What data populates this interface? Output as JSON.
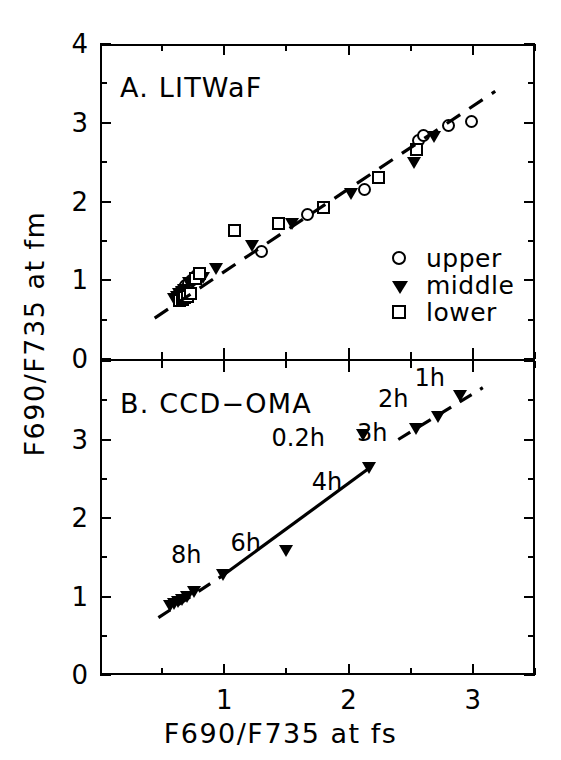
{
  "figure": {
    "axis_titles": {
      "x": "F690/F735 at fs",
      "y": "F690/F735 at fm"
    },
    "panels": [
      {
        "id": "A",
        "title": "A.   LITWaF"
      },
      {
        "id": "B",
        "title": "B.   CCD−OMA"
      }
    ],
    "legend": {
      "items": [
        {
          "symbol": "circle",
          "label": "upper"
        },
        {
          "symbol": "triangle",
          "label": "middle"
        },
        {
          "symbol": "square",
          "label": "lower"
        }
      ]
    },
    "tick_labels": {
      "panel_a_y": [
        "0",
        "1",
        "2",
        "3",
        "4"
      ],
      "panel_b_y": [
        "0",
        "1",
        "2",
        "3"
      ],
      "x": [
        "1",
        "2",
        "3"
      ]
    },
    "colors": {
      "axis": "#000000",
      "marker_fill_open": "#ffffff",
      "marker_fill_solid": "#000000"
    }
  },
  "chart_data": [
    {
      "type": "scatter",
      "panel": "A",
      "title": "A.   LITWaF",
      "xlabel": "F690/F735 at fs",
      "ylabel": "F690/F735 at fm",
      "xlim": [
        0,
        3.5
      ],
      "ylim": [
        0,
        4
      ],
      "xticks": [
        1,
        2,
        3
      ],
      "yticks": [
        0,
        1,
        2,
        3,
        4
      ],
      "grid": false,
      "legend_position": "lower-right-inside",
      "series": [
        {
          "name": "upper",
          "marker": "open-circle",
          "points": [
            [
              0.63,
              0.82
            ],
            [
              0.65,
              0.86
            ],
            [
              0.67,
              0.9
            ],
            [
              0.69,
              0.93
            ],
            [
              0.71,
              0.96
            ],
            [
              0.74,
              1.0
            ],
            [
              0.78,
              1.06
            ],
            [
              1.3,
              1.36
            ],
            [
              1.67,
              1.84
            ],
            [
              2.13,
              2.15
            ],
            [
              2.56,
              2.77
            ],
            [
              2.6,
              2.84
            ],
            [
              2.8,
              2.96
            ],
            [
              2.99,
              3.02
            ]
          ]
        },
        {
          "name": "middle",
          "marker": "filled-triangle",
          "points": [
            [
              0.6,
              0.76
            ],
            [
              0.62,
              0.79
            ],
            [
              0.64,
              0.82
            ],
            [
              0.66,
              0.85
            ],
            [
              0.68,
              0.88
            ],
            [
              0.72,
              0.96
            ],
            [
              0.83,
              1.03
            ],
            [
              0.94,
              1.14
            ],
            [
              1.23,
              1.43
            ],
            [
              1.55,
              1.71
            ],
            [
              2.02,
              2.09
            ],
            [
              2.53,
              2.49
            ],
            [
              2.69,
              2.82
            ]
          ]
        },
        {
          "name": "lower",
          "marker": "open-square",
          "points": [
            [
              0.64,
              0.74
            ],
            [
              0.66,
              0.76
            ],
            [
              0.68,
              0.78
            ],
            [
              0.7,
              0.8
            ],
            [
              0.73,
              0.83
            ],
            [
              0.77,
              1.02
            ],
            [
              0.8,
              1.09
            ],
            [
              1.08,
              1.63
            ],
            [
              1.44,
              1.72
            ],
            [
              1.8,
              1.92
            ],
            [
              2.24,
              2.3
            ],
            [
              2.55,
              2.66
            ]
          ]
        }
      ],
      "trend_line": {
        "style": "dashed",
        "from": [
          0.44,
          0.52
        ],
        "to": [
          3.18,
          3.4
        ]
      }
    },
    {
      "type": "scatter",
      "panel": "B",
      "title": "B.   CCD−OMA",
      "xlabel": "F690/F735 at fs",
      "ylabel": "F690/F735 at fm",
      "xlim": [
        0,
        3.5
      ],
      "ylim": [
        0,
        4
      ],
      "xticks": [
        1,
        2,
        3
      ],
      "yticks": [
        0,
        1,
        2,
        3
      ],
      "grid": false,
      "series": [
        {
          "name": "middle",
          "marker": "filled-triangle",
          "points": [
            [
              0.57,
              0.88
            ],
            [
              0.6,
              0.9
            ],
            [
              0.63,
              0.93
            ],
            [
              0.66,
              0.96
            ],
            [
              0.7,
              1.0
            ],
            [
              0.76,
              1.06
            ],
            [
              0.99,
              1.27
            ],
            [
              1.5,
              1.58
            ],
            [
              2.17,
              2.64
            ],
            [
              2.12,
              3.06
            ],
            [
              2.55,
              3.14
            ],
            [
              2.72,
              3.29
            ],
            [
              2.9,
              3.56
            ]
          ]
        }
      ],
      "annotations": [
        {
          "text": "1h",
          "point": [
            2.9,
            3.56
          ]
        },
        {
          "text": "2h",
          "point": [
            2.72,
            3.29
          ]
        },
        {
          "text": "3h",
          "point": [
            2.55,
            3.14
          ]
        },
        {
          "text": "0.2h",
          "point": [
            2.12,
            3.06
          ]
        },
        {
          "text": "4h",
          "point": [
            2.17,
            2.64
          ]
        },
        {
          "text": "6h",
          "point": [
            1.5,
            1.58
          ]
        },
        {
          "text": "8h",
          "point": [
            0.99,
            1.27
          ]
        }
      ],
      "trend_line": {
        "style": "solid-with-dashed-extensions",
        "solid_from": [
          0.99,
          1.27
        ],
        "solid_to": [
          2.17,
          2.64
        ],
        "dashed_lower_from": [
          0.47,
          0.73
        ],
        "dashed_lower_to": [
          0.99,
          1.27
        ],
        "dashed_upper_from": [
          2.4,
          3.0
        ],
        "dashed_upper_to": [
          3.08,
          3.66
        ]
      }
    }
  ]
}
